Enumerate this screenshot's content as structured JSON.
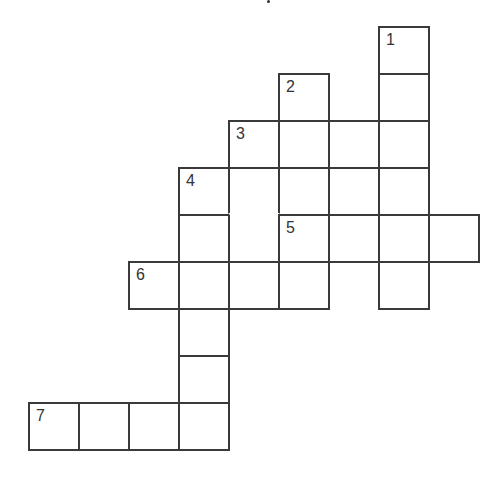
{
  "puzzle": {
    "type": "crossword",
    "cols": 9,
    "rows": 9,
    "cells": [
      {
        "r": 0,
        "c": 7,
        "num": "1"
      },
      {
        "r": 1,
        "c": 5,
        "num": "2"
      },
      {
        "r": 1,
        "c": 7
      },
      {
        "r": 2,
        "c": 4,
        "num": "3"
      },
      {
        "r": 2,
        "c": 5
      },
      {
        "r": 2,
        "c": 6
      },
      {
        "r": 2,
        "c": 7
      },
      {
        "r": 3,
        "c": 3,
        "num": "4"
      },
      {
        "r": 3,
        "c": 4,
        "merge_down": true
      },
      {
        "r": 3,
        "c": 5
      },
      {
        "r": 3,
        "c": 6
      },
      {
        "r": 3,
        "c": 7
      },
      {
        "r": 4,
        "c": 3
      },
      {
        "r": 4,
        "c": 4,
        "merged_up": true
      },
      {
        "r": 4,
        "c": 5,
        "num": "5"
      },
      {
        "r": 4,
        "c": 6
      },
      {
        "r": 4,
        "c": 7
      },
      {
        "r": 4,
        "c": 8
      },
      {
        "r": 5,
        "c": 2,
        "num": "6"
      },
      {
        "r": 5,
        "c": 3
      },
      {
        "r": 5,
        "c": 4
      },
      {
        "r": 5,
        "c": 5
      },
      {
        "r": 5,
        "c": 7
      },
      {
        "r": 6,
        "c": 3
      },
      {
        "r": 7,
        "c": 3
      },
      {
        "r": 8,
        "c": 0,
        "num": "7"
      },
      {
        "r": 8,
        "c": 1
      },
      {
        "r": 8,
        "c": 2
      },
      {
        "r": 8,
        "c": 3
      }
    ],
    "entries": [
      {
        "number": "1",
        "direction": "down"
      },
      {
        "number": "2",
        "direction": "down"
      },
      {
        "number": "3",
        "direction": "across"
      },
      {
        "number": "4",
        "direction": "down"
      },
      {
        "number": "5",
        "direction": "across"
      },
      {
        "number": "6",
        "direction": "across"
      },
      {
        "number": "7",
        "direction": "across"
      }
    ]
  }
}
